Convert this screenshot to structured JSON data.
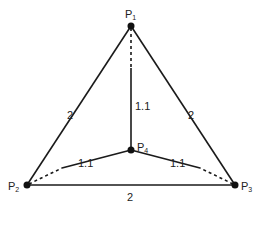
{
  "diagram": {
    "type": "weighted-graph",
    "nodes": [
      {
        "id": "P1",
        "label": "P",
        "sub": "1",
        "x": 131,
        "y": 26
      },
      {
        "id": "P2",
        "label": "P",
        "sub": "2",
        "x": 27,
        "y": 185
      },
      {
        "id": "P3",
        "label": "P",
        "sub": "3",
        "x": 235,
        "y": 185
      },
      {
        "id": "P4",
        "label": "P",
        "sub": "4",
        "x": 131,
        "y": 150
      }
    ],
    "edges": [
      {
        "from": "P1",
        "to": "P2",
        "weight": "2",
        "style": "solid"
      },
      {
        "from": "P1",
        "to": "P3",
        "weight": "2",
        "style": "solid"
      },
      {
        "from": "P2",
        "to": "P3",
        "weight": "2",
        "style": "solid"
      },
      {
        "from": "P1",
        "to": "P4",
        "weight": "1.1",
        "style": "partially-dashed"
      },
      {
        "from": "P2",
        "to": "P4",
        "weight": "1.1",
        "style": "partially-dashed"
      },
      {
        "from": "P3",
        "to": "P4",
        "weight": "1.1",
        "style": "partially-dashed"
      }
    ],
    "labels": {
      "p": "P",
      "p1_sub": "1",
      "p2_sub": "2",
      "p3_sub": "3",
      "p4_sub": "4",
      "w_p1p2": "2",
      "w_p1p3": "2",
      "w_p2p3": "2",
      "w_p1p4": "1.1",
      "w_p2p4": "1.1",
      "w_p3p4": "1.1"
    },
    "colors": {
      "line": "#1a1a1a",
      "node": "#111111",
      "background": "#ffffff"
    }
  }
}
